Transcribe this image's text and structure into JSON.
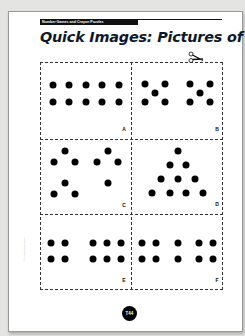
{
  "header": {
    "section": "Number Games and Crayon Puzzles",
    "title": "Quick Images: Pictures of 10"
  },
  "icons": {
    "scissors": "scissors-icon"
  },
  "panels": [
    {
      "label": "A",
      "label_pos": [
        124,
        129
      ],
      "dots": [
        [
          53,
          85
        ],
        [
          69,
          85
        ],
        [
          86,
          85
        ],
        [
          102,
          85
        ],
        [
          119,
          85
        ],
        [
          53,
          102
        ],
        [
          69,
          102
        ],
        [
          86,
          102
        ],
        [
          102,
          102
        ],
        [
          119,
          102
        ]
      ]
    },
    {
      "label": "B",
      "label_pos": [
        217,
        129
      ],
      "dots": [
        [
          145,
          84
        ],
        [
          165,
          84
        ],
        [
          155,
          93
        ],
        [
          145,
          102
        ],
        [
          165,
          102
        ],
        [
          190,
          84
        ],
        [
          210,
          84
        ],
        [
          200,
          93
        ],
        [
          190,
          102
        ],
        [
          210,
          102
        ]
      ]
    },
    {
      "label": "C",
      "label_pos": [
        124,
        205
      ],
      "dots": [
        [
          65,
          151
        ],
        [
          54,
          162
        ],
        [
          75,
          162
        ],
        [
          108,
          151
        ],
        [
          97,
          162
        ],
        [
          118,
          162
        ],
        [
          65,
          183
        ],
        [
          54,
          194
        ],
        [
          75,
          194
        ],
        [
          108,
          183
        ]
      ]
    },
    {
      "label": "D",
      "label_pos": [
        217,
        204
      ],
      "dots": [
        [
          178,
          151
        ],
        [
          170,
          165
        ],
        [
          186,
          165
        ],
        [
          161,
          179
        ],
        [
          178,
          179
        ],
        [
          195,
          179
        ],
        [
          152,
          193
        ],
        [
          170,
          193
        ],
        [
          186,
          193
        ],
        [
          203,
          193
        ]
      ]
    },
    {
      "label": "E",
      "label_pos": [
        124,
        280
      ],
      "dots": [
        [
          51,
          243
        ],
        [
          65,
          243
        ],
        [
          93,
          243
        ],
        [
          107,
          243
        ],
        [
          121,
          243
        ],
        [
          51,
          259
        ],
        [
          65,
          259
        ],
        [
          93,
          259
        ],
        [
          107,
          259
        ],
        [
          121,
          259
        ]
      ]
    },
    {
      "label": "F",
      "label_pos": [
        217,
        280
      ],
      "dots": [
        [
          142,
          243
        ],
        [
          156,
          243
        ],
        [
          178,
          243
        ],
        [
          199,
          243
        ],
        [
          213,
          243
        ],
        [
          142,
          259
        ],
        [
          156,
          259
        ],
        [
          178,
          259
        ],
        [
          199,
          259
        ],
        [
          213,
          259
        ]
      ]
    }
  ],
  "footer": {
    "page_number": "T44",
    "copyright": "© Pearson Education 2"
  },
  "colors": {
    "ink": "#000000",
    "title": "#101828",
    "paper": "#ffffff",
    "background": "#e4e4e2"
  }
}
